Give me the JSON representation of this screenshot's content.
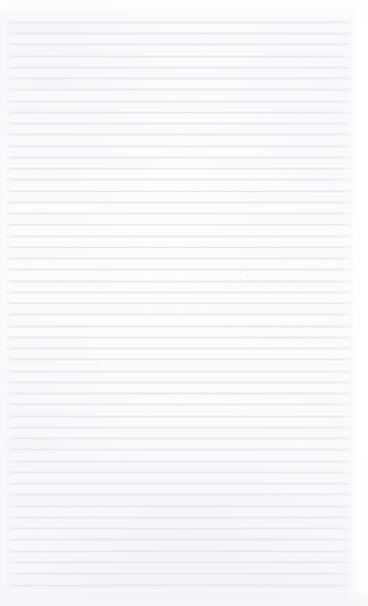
{
  "document": {
    "kind": "blank-ruled-paper",
    "description": "Blank sheet of ruled notebook paper, no handwriting or printed text",
    "width_px": 368,
    "height_px": 606,
    "text_content": "",
    "visible_text_lines": []
  },
  "paper": {
    "background_color": "#fcfcfd",
    "edge_tint_color": "#f3f3f5",
    "rule_color": "#e6e7ea",
    "rule_count": 51,
    "rule_spacing_px": 11.2,
    "first_rule_y_px": 22,
    "last_rule_y_px": 585,
    "rule_start_x_px": 5,
    "rule_end_x_px": 354,
    "rule_thickness_px": 1,
    "top_margin_px": 22,
    "bottom_margin_px": 21,
    "left_margin_px": 5,
    "right_margin_px": 14
  },
  "rules": [
    {
      "y": 22
    },
    {
      "y": 33
    },
    {
      "y": 44
    },
    {
      "y": 56
    },
    {
      "y": 67
    },
    {
      "y": 78
    },
    {
      "y": 89
    },
    {
      "y": 101
    },
    {
      "y": 112
    },
    {
      "y": 123
    },
    {
      "y": 134
    },
    {
      "y": 146
    },
    {
      "y": 157
    },
    {
      "y": 168
    },
    {
      "y": 179
    },
    {
      "y": 191
    },
    {
      "y": 202
    },
    {
      "y": 213
    },
    {
      "y": 224
    },
    {
      "y": 236
    },
    {
      "y": 247
    },
    {
      "y": 258
    },
    {
      "y": 269
    },
    {
      "y": 281
    },
    {
      "y": 292
    },
    {
      "y": 303
    },
    {
      "y": 314
    },
    {
      "y": 326
    },
    {
      "y": 337
    },
    {
      "y": 348
    },
    {
      "y": 359
    },
    {
      "y": 371
    },
    {
      "y": 382
    },
    {
      "y": 393
    },
    {
      "y": 404
    },
    {
      "y": 416
    },
    {
      "y": 427
    },
    {
      "y": 438
    },
    {
      "y": 449
    },
    {
      "y": 461
    },
    {
      "y": 472
    },
    {
      "y": 483
    },
    {
      "y": 494
    },
    {
      "y": 506
    },
    {
      "y": 517
    },
    {
      "y": 528
    },
    {
      "y": 539
    },
    {
      "y": 551
    },
    {
      "y": 562
    },
    {
      "y": 573
    },
    {
      "y": 585
    }
  ],
  "specks": [
    {
      "x": 181,
      "y": 404,
      "size": 3
    },
    {
      "x": 60,
      "y": 543,
      "size": 3
    },
    {
      "x": 133,
      "y": 92,
      "size": 2
    },
    {
      "x": 262,
      "y": 157,
      "size": 2
    },
    {
      "x": 203,
      "y": 55,
      "size": 2
    },
    {
      "x": 320,
      "y": 489,
      "size": 2
    },
    {
      "x": 97,
      "y": 366,
      "size": 2
    },
    {
      "x": 246,
      "y": 274,
      "size": 2
    }
  ]
}
